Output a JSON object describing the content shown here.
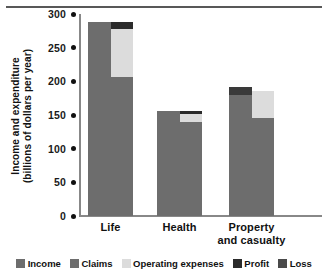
{
  "chart_data": {
    "type": "bar",
    "subtype": "stacked-paired",
    "title": "",
    "xlabel": "",
    "ylabel": "Income and expenditure (billions of dollars per year)",
    "ylabel_line1": "Income and expenditure",
    "ylabel_line2": "(billions of dollars per year)",
    "ylim": [
      0,
      300
    ],
    "yticks": [
      300,
      250,
      200,
      150,
      100,
      50,
      0
    ],
    "ytick_labels": [
      "300",
      "250",
      "200",
      "150",
      "100",
      "50",
      "0"
    ],
    "grid": false,
    "legend_position": "bottom",
    "categories": [
      "Life",
      "Health",
      "Property and casualty"
    ],
    "category_labels": [
      {
        "line1": "Life",
        "line2": ""
      },
      {
        "line1": "Health",
        "line2": ""
      },
      {
        "line1": "Property",
        "line2": "and casualty"
      }
    ],
    "series": [
      {
        "name": "Income",
        "values": [
          288,
          156,
          192
        ]
      },
      {
        "name": "Claims",
        "values": [
          207,
          140,
          145
        ]
      },
      {
        "name": "Operating expenses",
        "values": [
          71,
          12,
          40
        ]
      },
      {
        "name": "Profit",
        "values": [
          10,
          4,
          0
        ]
      },
      {
        "name": "Loss",
        "values": [
          0,
          0,
          12
        ]
      }
    ],
    "bars": [
      {
        "category": "Life",
        "income": {
          "label": "Income",
          "value": 288,
          "start": 0,
          "end": 288
        },
        "stack": [
          {
            "label": "Claims",
            "value": 207,
            "start": 0,
            "end": 207
          },
          {
            "label": "Operating expenses",
            "value": 71,
            "start": 207,
            "end": 278
          },
          {
            "label": "Profit",
            "value": 10,
            "start": 278,
            "end": 288
          }
        ]
      },
      {
        "category": "Health",
        "income": {
          "label": "Income",
          "value": 156,
          "start": 0,
          "end": 156
        },
        "stack": [
          {
            "label": "Claims",
            "value": 140,
            "start": 0,
            "end": 140
          },
          {
            "label": "Operating expenses",
            "value": 12,
            "start": 140,
            "end": 152
          },
          {
            "label": "Profit",
            "value": 4,
            "start": 152,
            "end": 156
          }
        ]
      },
      {
        "category": "Property and casualty",
        "income": {
          "label": "Income",
          "value": 180,
          "start": 0,
          "end": 180
        },
        "loss": {
          "label": "Loss",
          "value": 12,
          "start": 180,
          "end": 192
        },
        "stack": [
          {
            "label": "Claims",
            "value": 145,
            "start": 0,
            "end": 145
          },
          {
            "label": "Operating expenses",
            "value": 40,
            "start": 145,
            "end": 185
          }
        ]
      }
    ],
    "legend": [
      {
        "label": "Income",
        "color": "#6d6d6d"
      },
      {
        "label": "Claims",
        "color": "#6d6d6d"
      },
      {
        "label": "Operating expenses",
        "color": "#dcdcdc"
      },
      {
        "label": "Profit",
        "color": "#2b2b2b"
      },
      {
        "label": "Loss",
        "color": "#4a4a4a"
      }
    ],
    "colors": {
      "income": "#6d6d6d",
      "claims": "#6d6d6d",
      "operating_expenses": "#dcdcdc",
      "profit": "#2b2b2b",
      "loss": "#3a3a3a",
      "axis": "#888888",
      "text": "#111111",
      "background": "#ffffff"
    }
  }
}
